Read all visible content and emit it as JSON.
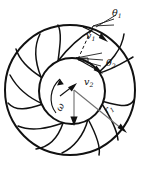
{
  "figure": {
    "stroke_color": "#111111",
    "gray_color": "#6f6f6f",
    "background_color": "#ffffff"
  },
  "geometry": {
    "outer_circle": {
      "cx": 70,
      "cy": 90,
      "r": 65,
      "stroke_width": 2.0
    },
    "inner_circle": {
      "cx": 72,
      "cy": 91,
      "r": 33,
      "stroke_width": 2.0
    },
    "blade_count": 7
  },
  "labels": {
    "theta1": {
      "base": "θ",
      "sub": "1",
      "x": 119,
      "y": 13
    },
    "theta2": {
      "base": "θ",
      "sub": "2",
      "x": 108,
      "y": 63
    },
    "v1": {
      "base": "v",
      "sub": "1",
      "x": 90,
      "y": 36
    },
    "v2": {
      "base": "v",
      "sub": "2",
      "x": 88,
      "y": 82
    },
    "omega": {
      "base": "ω",
      "sub": "",
      "x": 65,
      "y": 110
    },
    "r1": {
      "base": "r",
      "sub": "1",
      "x": 111,
      "y": 112
    }
  },
  "annotations": {
    "theta1_desc": "blade inlet angle at the outer rim",
    "theta2_desc": "blade outlet angle at the inner hub",
    "v1_desc": "velocity vector at the outer radius",
    "v2_desc": "velocity vector at the inner radius",
    "omega_desc": "angular velocity of the impeller",
    "r1_desc": "outer radius arrow from hub centre to rim"
  }
}
